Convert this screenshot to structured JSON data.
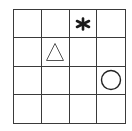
{
  "grid": {
    "rows": 4,
    "cols": 4,
    "line_color": "#3a3a3a",
    "background": "#ffffff"
  },
  "shapes": [
    {
      "type": "star",
      "icon": "asterisk-star-icon",
      "row": 0,
      "col": 2,
      "glyph": "*",
      "color": "#1a1a1a",
      "filled": true
    },
    {
      "type": "triangle",
      "icon": "triangle-icon",
      "row": 1,
      "col": 1,
      "color": "#555555",
      "filled": false
    },
    {
      "type": "circle",
      "icon": "circle-icon",
      "row": 2,
      "col": 3,
      "color": "#222222",
      "filled": false
    }
  ]
}
